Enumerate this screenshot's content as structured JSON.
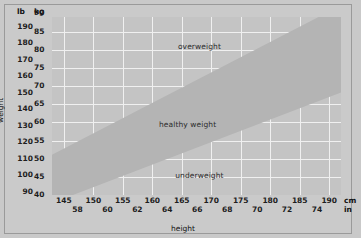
{
  "chart_data": {
    "type": "area",
    "title": "",
    "xlabel": "height",
    "ylabel": "weight",
    "grid": true,
    "legend": "none",
    "x_axis": {
      "primary_unit": "cm",
      "secondary_unit": "in",
      "cm_ticks": [
        145,
        150,
        155,
        160,
        165,
        170,
        175,
        180,
        185,
        190
      ],
      "in_ticks": [
        58,
        60,
        62,
        64,
        66,
        68,
        70,
        72,
        74
      ],
      "cm_range": [
        143,
        192
      ],
      "in_range": [
        56.3,
        75.6
      ]
    },
    "y_axis": {
      "primary_unit": "lb",
      "secondary_unit": "kg",
      "lb_ticks": [
        90,
        100,
        110,
        120,
        130,
        140,
        150,
        160,
        170,
        180,
        190
      ],
      "kg_ticks": [
        40,
        45,
        50,
        55,
        60,
        65,
        70,
        75,
        80,
        85,
        90
      ],
      "lb_range": [
        88,
        196
      ],
      "kg_range": [
        40,
        89
      ]
    },
    "bands": [
      {
        "name": "overweight",
        "label": "overweight",
        "bmi_range": [
          25,
          99
        ],
        "color": "#c4c4c4"
      },
      {
        "name": "healthy weight",
        "label": "healthy weight",
        "bmi_range": [
          18.5,
          25
        ],
        "color": "#b4b4b4"
      },
      {
        "name": "underweight",
        "label": "underweight",
        "bmi_range": [
          0,
          18.5
        ],
        "color": "#c4c4c4"
      }
    ],
    "boundaries": [
      {
        "name": "bmi-25-line",
        "points_cm_kg": [
          [
            143,
            51.1
          ],
          [
            192,
            92.2
          ]
        ]
      },
      {
        "name": "bmi-18p5-line",
        "points_cm_kg": [
          [
            143,
            37.8
          ],
          [
            192,
            68.2
          ]
        ]
      }
    ]
  },
  "axis_headers": {
    "lb": "lb",
    "kg": "kg",
    "cm": "cm",
    "in": "in"
  },
  "axis_titles": {
    "x": "height",
    "y": "weight"
  },
  "colors": {
    "page_background": "#c9c9c9",
    "plot_background": "#c4c4c4",
    "healthy_band": "#b4b4b4",
    "gridline": "#f0f0f0",
    "text": "#1d1d1d",
    "border": "#9a9a9a"
  }
}
